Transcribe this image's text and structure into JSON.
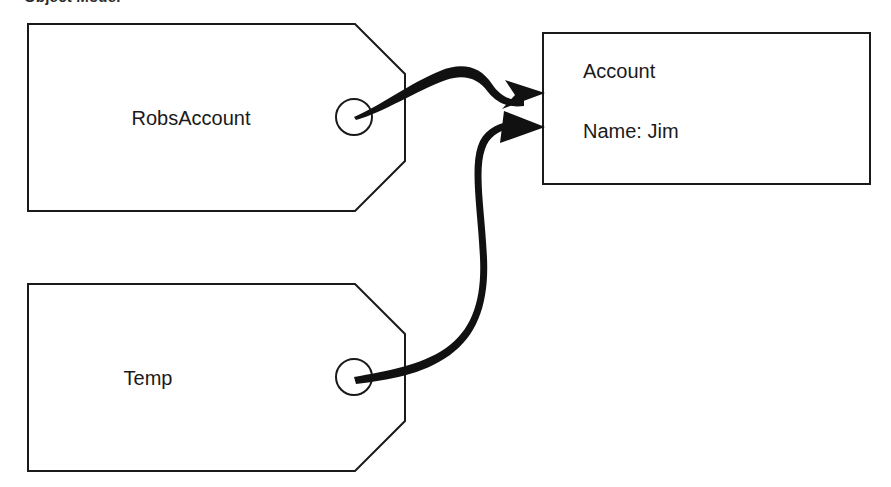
{
  "caption": {
    "text": "Object Model",
    "note": "clipped at top edge of image"
  },
  "objects": [
    {
      "id": "robsaccount-tag",
      "kind": "tag",
      "label": "RobsAccount",
      "anchor_label": "anchor-circle"
    },
    {
      "id": "temp-tag",
      "kind": "tag",
      "label": "Temp",
      "anchor_label": "anchor-circle"
    }
  ],
  "target_box": {
    "id": "account-box",
    "title": "Account",
    "attribute": "Name: Jim"
  },
  "links": [
    {
      "id": "link-robsaccount-to-account",
      "from": "robsaccount-tag",
      "to": "account-box",
      "arrow_style": "barbed"
    },
    {
      "id": "link-temp-to-account",
      "from": "temp-tag",
      "to": "account-box",
      "arrow_style": "solid-triangle"
    }
  ],
  "colors": {
    "stroke": "#1a1a1a",
    "fill": "#ffffff",
    "link": "#111111",
    "text": "#1a1a1a"
  },
  "geometry": {
    "tag_top": {
      "outline": "28,24 355,24 405,74 405,161 355,211 28,211",
      "circle": {
        "cx": 354,
        "cy": 117,
        "r": 18
      },
      "label_pos": {
        "x": 191,
        "y": 125
      }
    },
    "tag_bottom": {
      "outline": "28,284 355,284 405,334 405,421 355,471 28,471",
      "circle": {
        "cx": 354,
        "cy": 377,
        "r": 18
      },
      "label_pos": {
        "x": 148,
        "y": 385
      }
    },
    "box": {
      "x": 543,
      "y": 33,
      "width": 327,
      "height": 151
    },
    "box_title_pos": {
      "x": 583,
      "y": 78
    },
    "box_attr_pos": {
      "x": 583,
      "y": 138
    }
  }
}
